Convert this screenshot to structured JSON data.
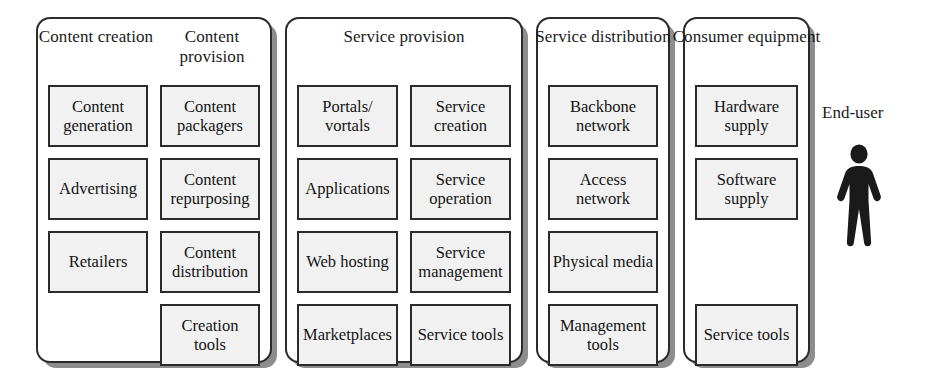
{
  "diagram": {
    "title_text": "Internet value chain",
    "colors": {
      "box_fill": "#f1f1f1",
      "line": "#2b2b2b",
      "shadow": "#8d8d8d",
      "figure": "#1a1a1a",
      "background": "#ffffff"
    }
  },
  "panels": [
    {
      "id": "content",
      "layout": "two-column",
      "headers": [
        "Content creation",
        "Content provision"
      ],
      "columns": [
        [
          "Content generation",
          "Advertising",
          "Retailers"
        ],
        [
          "Content packagers",
          "Content repurposing",
          "Content distribution",
          "Creation tools"
        ]
      ]
    },
    {
      "id": "service-provision",
      "layout": "two-column-single-title",
      "headers": [
        "Service provision"
      ],
      "columns": [
        [
          "Portals/ vortals",
          "Applications",
          "Web hosting",
          "Marketplaces"
        ],
        [
          "Service creation",
          "Service operation",
          "Service management",
          "Service tools"
        ]
      ]
    },
    {
      "id": "service-distribution",
      "layout": "one-column",
      "headers": [
        "Service distribution"
      ],
      "columns": [
        [
          "Backbone network",
          "Access network",
          "Physical media",
          "Management tools"
        ]
      ]
    },
    {
      "id": "consumer-equipment",
      "layout": "one-column",
      "headers": [
        "Consumer equipment"
      ],
      "columns": [
        [
          "Hardware supply",
          "Software supply",
          "",
          "Service tools"
        ]
      ]
    }
  ],
  "end_user": {
    "label": "End-user",
    "icon": "person-icon"
  }
}
